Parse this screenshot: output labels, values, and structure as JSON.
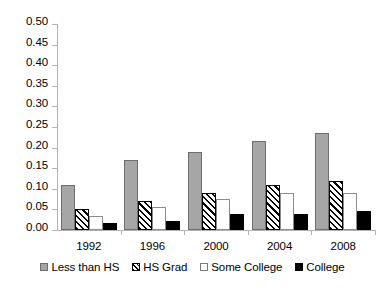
{
  "chart_data": {
    "type": "bar",
    "title": "",
    "xlabel": "",
    "ylabel": "",
    "categories": [
      "1992",
      "1996",
      "2000",
      "2004",
      "2008"
    ],
    "series": [
      {
        "name": "Less than HS",
        "pattern": "solid-gray",
        "color": "#a6a6a6",
        "values": [
          0.11,
          0.17,
          0.19,
          0.215,
          0.235
        ]
      },
      {
        "name": "HS Grad",
        "pattern": "diagonal-hatch",
        "color": "#000000",
        "values": [
          0.05,
          0.07,
          0.09,
          0.11,
          0.12
        ]
      },
      {
        "name": "Some College",
        "pattern": "white-outline",
        "color": "#ffffff",
        "values": [
          0.033,
          0.055,
          0.075,
          0.09,
          0.09
        ]
      },
      {
        "name": "College",
        "pattern": "solid-black",
        "color": "#000000",
        "values": [
          0.018,
          0.022,
          0.04,
          0.04,
          0.045
        ]
      }
    ],
    "ylim": [
      0.0,
      0.5
    ],
    "yticks": [
      "0.50",
      "0.45",
      "0.40",
      "0.35",
      "0.30",
      "0.25",
      "0.20",
      "0.15",
      "0.10",
      "0.05",
      "0.00"
    ],
    "ytick_values": [
      0.5,
      0.45,
      0.4,
      0.35,
      0.3,
      0.25,
      0.2,
      0.15,
      0.1,
      0.05,
      0.0
    ],
    "grid": false,
    "legend_position": "bottom"
  },
  "legend": {
    "items": [
      {
        "label": "Less than HS"
      },
      {
        "label": "HS Grad"
      },
      {
        "label": "Some College"
      },
      {
        "label": "College"
      }
    ]
  }
}
